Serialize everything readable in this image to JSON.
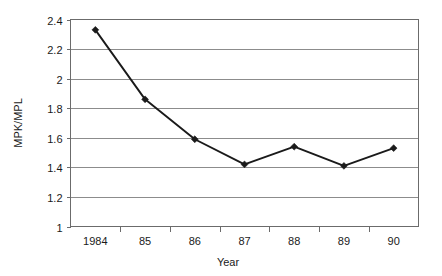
{
  "chart_data": {
    "type": "line",
    "title": "",
    "xlabel": "Year",
    "ylabel": "MPK/MPL",
    "categories": [
      "1984",
      "85",
      "86",
      "87",
      "88",
      "89",
      "90"
    ],
    "values": [
      2.33,
      1.86,
      1.59,
      1.42,
      1.54,
      1.41,
      1.53
    ],
    "series": [
      {
        "name": "MPK/MPL",
        "values": [
          2.33,
          1.86,
          1.59,
          1.42,
          1.54,
          1.41,
          1.53
        ]
      }
    ],
    "ylim": [
      1,
      2.4
    ],
    "yticks": [
      "1",
      "1.2",
      "1.4",
      "1.6",
      "1.8",
      "2",
      "2.2",
      "2.4"
    ],
    "ytick_values": [
      1,
      1.2,
      1.4,
      1.6,
      1.8,
      2,
      2.2,
      2.4
    ],
    "grid": true,
    "legend": "none",
    "marker": "diamond",
    "colors": {
      "line": "#1a1a1a",
      "marker": "#1a1a1a",
      "grid": "#8c8c8c",
      "frame": "#6b6b6b",
      "background": "#ffffff",
      "text": "#1a1a1a"
    }
  },
  "axes": {
    "x_title": "Year",
    "y_title": "MPK/MPL"
  }
}
